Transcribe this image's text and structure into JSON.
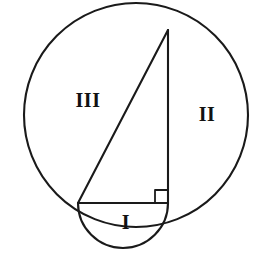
{
  "figure": {
    "background_color": "#ffffff",
    "stroke_color": "#1a1a1a",
    "canvas": {
      "width": 272,
      "height": 253
    },
    "labels": [
      {
        "name": "region-label-iii",
        "text": "III",
        "x": 88,
        "y": 100
      },
      {
        "name": "region-label-ii",
        "text": "II",
        "x": 207,
        "y": 114
      },
      {
        "name": "region-label-i",
        "text": "I",
        "x": 126,
        "y": 222
      }
    ],
    "shapes": {
      "large_circle": {
        "name": "large-circle",
        "center_x": 136,
        "center_y": 115,
        "radius": 112,
        "stroke_width": 2.1
      },
      "small_semicircle": {
        "name": "small-semicircle",
        "left_x": 78,
        "left_y": 203,
        "right_x": 168,
        "right_y": 203,
        "radius": 45,
        "bulge": "down",
        "stroke_width": 2.1
      },
      "triangle": {
        "name": "right-triangle",
        "apex_x": 168,
        "apex_y": 30,
        "left_x": 78,
        "left_y": 203,
        "corner_x": 168,
        "corner_y": 203,
        "stroke_width": 2.1
      },
      "right_angle_marker": {
        "name": "right-angle-marker",
        "corner_x": 168,
        "corner_y": 203,
        "size": 13,
        "stroke_width": 1.8
      }
    }
  }
}
